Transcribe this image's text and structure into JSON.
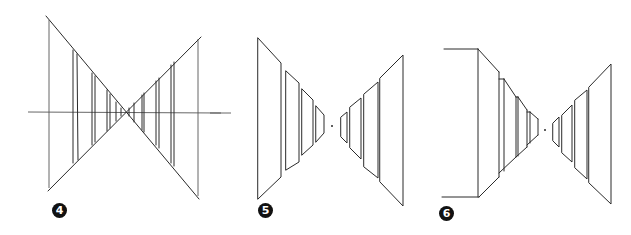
{
  "figures": [
    {
      "id": "fig-4",
      "label": "4",
      "description": "Crossed diagonals with horizon line and vertical pairs converging at a single vanishing point"
    },
    {
      "id": "fig-5",
      "label": "5",
      "description": "Pairs of receding panels on both sides of a central vanishing point"
    },
    {
      "id": "fig-6",
      "label": "6",
      "description": "Stepped stacked boxes on the left and receding panels on the right around a vanishing point"
    }
  ],
  "colors": {
    "stroke": "#2a2a2a",
    "badge_bg": "#111111",
    "badge_text": "#ffffff",
    "background": "#ffffff"
  }
}
